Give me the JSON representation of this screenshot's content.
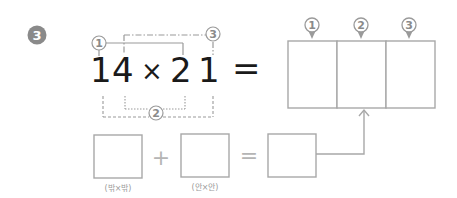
{
  "problem": {
    "number": "3",
    "badge_color": "#8a8a8a"
  },
  "equation": {
    "left_operand": "14",
    "operator": "×",
    "right_operand": "21",
    "equals": "=",
    "digits": [
      "1",
      "4",
      "2",
      "1"
    ]
  },
  "markers": {
    "one": "1",
    "two": "2",
    "three": "3"
  },
  "result_box": {
    "cells": [
      {
        "marker": "1",
        "value": ""
      },
      {
        "marker": "2",
        "value": ""
      },
      {
        "marker": "3",
        "value": ""
      }
    ]
  },
  "bottom_row": {
    "plus": "+",
    "equals": "=",
    "box1_caption": "(밖×밖)",
    "box2_caption": "(안×안)",
    "box1_value": "",
    "box2_value": "",
    "box3_value": ""
  },
  "colors": {
    "line": "#9a9a9a",
    "text": "#1a1a1a",
    "box_border": "#a8a8a8"
  }
}
